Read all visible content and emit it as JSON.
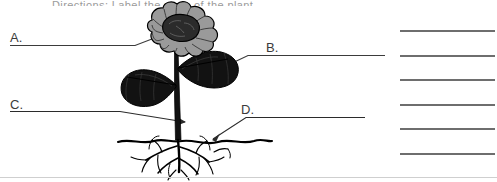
{
  "document": {
    "kind": "labeling-worksheet",
    "subject": "plant-parts",
    "cropped_header_text": "Directions: Label the parts of the plant.",
    "page_rule_color": "#cfcfcf",
    "background": "#ffffff"
  },
  "labels": [
    {
      "id": "A",
      "text": "A.",
      "pointer_target": "flower",
      "has_arrowhead": false
    },
    {
      "id": "B",
      "text": "B.",
      "pointer_target": "leaf",
      "has_arrowhead": false
    },
    {
      "id": "C",
      "text": "C.",
      "pointer_target": "stem",
      "has_arrowhead": true
    },
    {
      "id": "D",
      "text": "D.",
      "pointer_target": "roots",
      "has_arrowhead": true
    }
  ],
  "answer_lines": {
    "count": 6,
    "tops": [
      30,
      55,
      79,
      104,
      128,
      153
    ],
    "left": 400,
    "width": 95,
    "color": "#6e6e6e",
    "values": [
      "",
      "",
      "",
      "",
      "",
      ""
    ]
  },
  "diagram": {
    "name": "flowering-plant-cross-section",
    "parts": [
      {
        "name": "flower",
        "icon": "flower-icon",
        "petal_color": "#9a9a9a",
        "center_color": "#2b2b2b"
      },
      {
        "name": "leaf-right",
        "icon": "leaf-icon",
        "color": "#111111"
      },
      {
        "name": "leaf-left",
        "icon": "leaf-icon",
        "color": "#111111"
      },
      {
        "name": "stem",
        "icon": "stem-icon",
        "color": "#111111"
      },
      {
        "name": "soil-line",
        "icon": "soil-line-icon",
        "color": "#000000"
      },
      {
        "name": "roots",
        "icon": "roots-icon",
        "color": "#000000"
      }
    ],
    "line_color": "#3b3b3b"
  }
}
